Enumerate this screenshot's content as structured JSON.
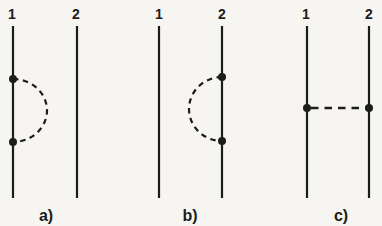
{
  "figure": {
    "panels": [
      {
        "caption": "a)",
        "left_line_label": "1",
        "right_line_label": "2"
      },
      {
        "caption": "b)",
        "left_line_label": "1",
        "right_line_label": "2"
      },
      {
        "caption": "c)",
        "left_line_label": "1",
        "right_line_label": "2"
      }
    ]
  },
  "colors": {
    "ink": "#1c1c1c",
    "paper": "#f6f5f1"
  }
}
